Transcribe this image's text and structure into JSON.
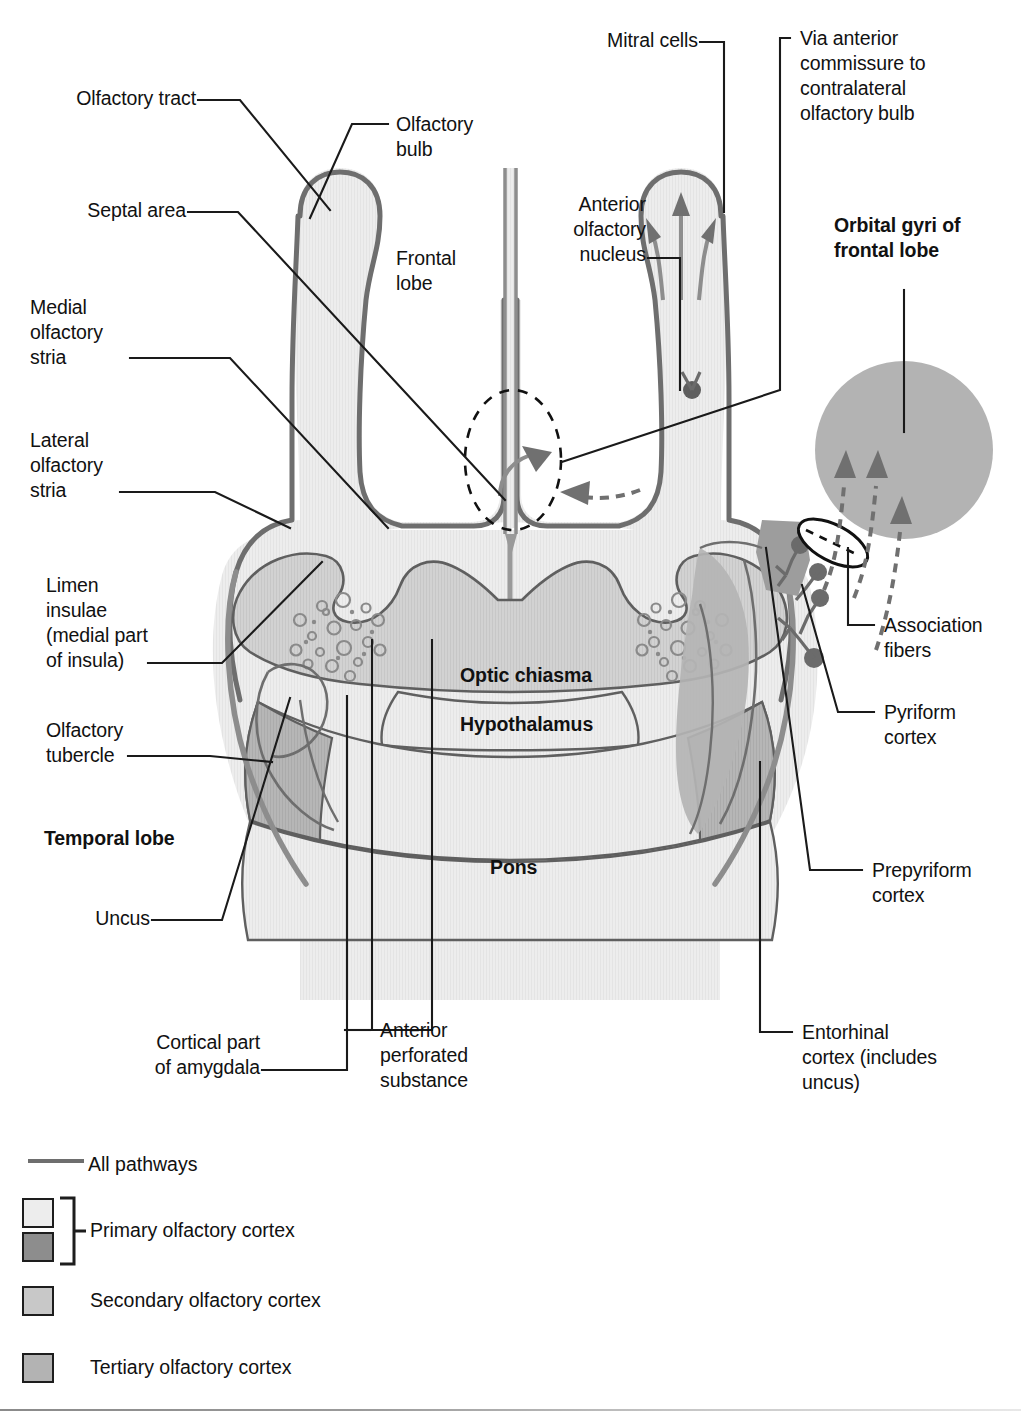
{
  "figure": {
    "type": "anatomical-diagram"
  },
  "labels": {
    "olfactory_tract": "Olfactory tract",
    "septal_area": "Septal area",
    "medial_olfactory_stria": "Medial\nolfactory\nstria",
    "lateral_olfactory_stria": "Lateral\nolfactory\nstria",
    "limen_insulae": "Limen\ninsulae\n(medial part\nof insula)",
    "olfactory_tubercle": "Olfactory\ntubercle",
    "temporal_lobe": "Temporal lobe",
    "uncus": "Uncus",
    "cortical_part_amygdala": "Cortical part\nof amygdala",
    "anterior_perforated_substance": "Anterior\nperforated\nsubstance",
    "olfactory_bulb": "Olfactory\nbulb",
    "frontal_lobe": "Frontal\nlobe",
    "mitral_cells": "Mitral cells",
    "anterior_olfactory_nucleus": "Anterior\nolfactory\nnucleus",
    "via_anterior_commissure": "Via anterior\ncommissure to\ncontralateral\nolfactory bulb",
    "orbital_gyri": "Orbital gyri of\nfrontal lobe",
    "association_fibers": "Association\nfibers",
    "pyriform_cortex": "Pyriform\ncortex",
    "prepyriform_cortex": "Prepyriform\ncortex",
    "entorhinal_cortex": "Entorhinal\ncortex (includes\nuncus)",
    "optic_chiasma": "Optic chiasma",
    "hypothalamus": "Hypothalamus",
    "pons": "Pons"
  },
  "legend": {
    "items": [
      {
        "id": "all-pathways",
        "label": "All pathways",
        "kind": "line",
        "color": "#6e6e6e"
      },
      {
        "id": "primary-olfactory-cortex",
        "label": "Primary olfactory cortex",
        "kind": "bracket-pair",
        "color_top": "#eeeeee",
        "color_bottom": "#8d8d8d"
      },
      {
        "id": "secondary-olfactory-cortex",
        "label": "Secondary olfactory cortex",
        "kind": "swatch",
        "color": "#c8c8c8"
      },
      {
        "id": "tertiary-olfactory-cortex",
        "label": "Tertiary olfactory cortex",
        "kind": "swatch",
        "color": "#b3b3b3"
      }
    ]
  },
  "palette": {
    "outline": "#6e6e6e",
    "leader": "#1a1a1a",
    "fill_lightest": "#efefef",
    "fill_light": "#e2e2e2",
    "fill_mid": "#cfcfcf",
    "fill_dark": "#b0b0b0",
    "fill_darker": "#9a9a9a",
    "arrow": "#707070",
    "node": "#6b6b6b"
  }
}
